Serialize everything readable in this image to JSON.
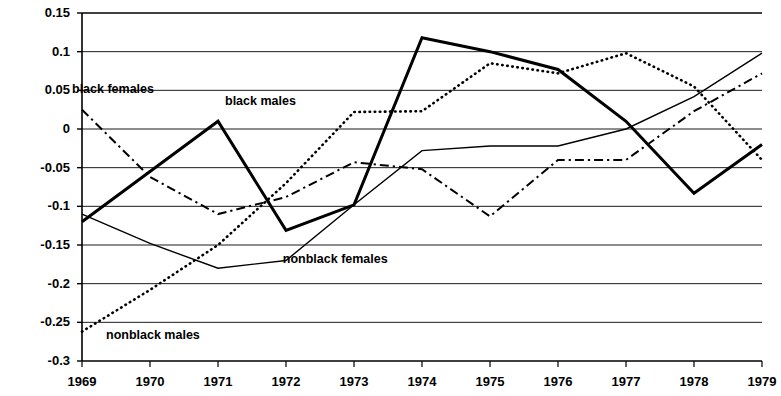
{
  "chart_data": {
    "type": "line",
    "title": "",
    "subtitle": "",
    "xlabel": "",
    "ylabel": "",
    "grid": true,
    "legend_position": "inline-annotations",
    "x": [
      1969,
      1970,
      1971,
      1972,
      1973,
      1974,
      1975,
      1976,
      1977,
      1978,
      1979
    ],
    "categories": [
      "1969",
      "1970",
      "1971",
      "1972",
      "1973",
      "1974",
      "1975",
      "1976",
      "1977",
      "1978",
      "1979"
    ],
    "xlim": [
      1969,
      1979
    ],
    "ylim": [
      -0.3,
      0.15
    ],
    "ytick_values": [
      0.15,
      0.1,
      0.05,
      0,
      -0.05,
      -0.1,
      -0.15,
      -0.2,
      -0.25,
      -0.3
    ],
    "ytick_labels": [
      "0.15",
      "0.1",
      "0.05",
      "0",
      "-0.05",
      "-0.1",
      "-0.15",
      "-0.2",
      "-0.25",
      "-0.3"
    ],
    "series": [
      {
        "name": "black males",
        "style": "thick-solid",
        "label_x": 1971.25,
        "label_y": 0.035,
        "values": [
          -0.12,
          -0.055,
          0.01,
          -0.131,
          -0.098,
          0.118,
          0.1,
          0.077,
          0.01,
          -0.083,
          -0.02
        ]
      },
      {
        "name": "black females",
        "style": "dash-dot",
        "label_x": 1969.0,
        "label_y": 0.05,
        "values": [
          0.025,
          -0.062,
          -0.11,
          -0.088,
          -0.043,
          -0.052,
          -0.113,
          -0.04,
          -0.04,
          0.023,
          0.072
        ]
      },
      {
        "name": "nonblack males",
        "style": "dotted",
        "label_x": 1969.5,
        "label_y": -0.268,
        "values": [
          -0.262,
          -0.208,
          -0.15,
          -0.07,
          0.022,
          0.023,
          0.085,
          0.072,
          0.098,
          0.055,
          -0.04
        ]
      },
      {
        "name": "nonblack females",
        "style": "thin-solid",
        "label_x": 1972.1,
        "label_y": -0.17,
        "values": [
          -0.11,
          -0.148,
          -0.18,
          -0.17,
          -0.098,
          -0.028,
          -0.022,
          -0.022,
          0.0,
          0.042,
          0.098
        ]
      }
    ]
  },
  "axis": {
    "color": "#000000",
    "gridline_color": "#000000"
  }
}
